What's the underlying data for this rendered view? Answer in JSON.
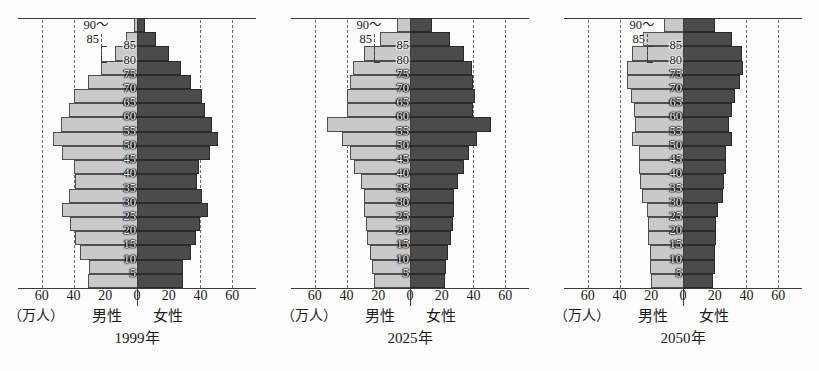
{
  "figure": {
    "unit_label": "（万人）",
    "male_label": "男性",
    "female_label": "女性",
    "age_top_label": "90～",
    "age_second_label": "85",
    "colors": {
      "male_bar": "#c9c9c9",
      "female_bar": "#4b4b4b",
      "gridline": "#6b6b90",
      "axis": "#3a3a3a",
      "background": "#fdfdfd"
    }
  },
  "chart_data": [
    {
      "type": "bar",
      "title": "1999年",
      "subtype": "population-pyramid",
      "xlabel": "（万人）",
      "ylabel": "",
      "xlim": [
        -75,
        75
      ],
      "xticks": [
        -60,
        -40,
        -20,
        0,
        20,
        40,
        60
      ],
      "xticklabels": [
        "60",
        "40",
        "20",
        "0",
        "20",
        "40",
        "60"
      ],
      "grid": true,
      "gridline_values": [
        -60,
        -40,
        40,
        60
      ],
      "legend": [
        "男性",
        "女性"
      ],
      "categories": [
        "0～4",
        "5～9",
        "10～14",
        "15～19",
        "20～24",
        "25～29",
        "30～34",
        "35～39",
        "40～44",
        "45～49",
        "50～54",
        "55～59",
        "60～64",
        "65～69",
        "70～74",
        "75～79",
        "80～84",
        "85～89",
        "90～"
      ],
      "ytick_labels": [
        "5",
        "10",
        "15",
        "20",
        "25",
        "30",
        "35",
        "40",
        "45",
        "50",
        "55",
        "60",
        "65",
        "70",
        "75",
        "80",
        "85",
        "90～"
      ],
      "series": [
        {
          "name": "男性",
          "values": [
            31,
            30,
            36,
            39,
            42,
            47,
            43,
            39,
            40,
            47,
            53,
            48,
            43,
            40,
            31,
            23,
            14,
            7,
            2
          ]
        },
        {
          "name": "女性",
          "values": [
            29,
            29,
            34,
            37,
            40,
            45,
            41,
            38,
            39,
            46,
            51,
            47,
            43,
            41,
            34,
            28,
            20,
            12,
            5
          ]
        }
      ]
    },
    {
      "type": "bar",
      "title": "2025年",
      "subtype": "population-pyramid",
      "xlabel": "（万人）",
      "ylabel": "",
      "xlim": [
        -75,
        75
      ],
      "xticks": [
        -60,
        -40,
        -20,
        0,
        20,
        40,
        60
      ],
      "xticklabels": [
        "60",
        "40",
        "20",
        "0",
        "20",
        "40",
        "60"
      ],
      "grid": true,
      "gridline_values": [
        -60,
        -40,
        40,
        60
      ],
      "legend": [
        "男性",
        "女性"
      ],
      "categories": [
        "0～4",
        "5～9",
        "10～14",
        "15～19",
        "20～24",
        "25～29",
        "30～34",
        "35～39",
        "40～44",
        "45～49",
        "50～54",
        "55～59",
        "60～64",
        "65～69",
        "70～74",
        "75～79",
        "80～84",
        "85～89",
        "90～"
      ],
      "ytick_labels": [
        "5",
        "10",
        "15",
        "20",
        "25",
        "30",
        "35",
        "40",
        "45",
        "50",
        "55",
        "60",
        "65",
        "70",
        "75",
        "80",
        "85",
        "90～"
      ],
      "series": [
        {
          "name": "男性",
          "values": [
            23,
            24,
            25,
            27,
            28,
            29,
            29,
            31,
            35,
            38,
            43,
            52,
            40,
            40,
            38,
            36,
            29,
            19,
            8
          ]
        },
        {
          "name": "女性",
          "values": [
            22,
            23,
            24,
            26,
            27,
            28,
            28,
            30,
            34,
            37,
            42,
            51,
            40,
            41,
            40,
            39,
            34,
            25,
            14
          ]
        }
      ]
    },
    {
      "type": "bar",
      "title": "2050年",
      "subtype": "population-pyramid",
      "xlabel": "（万人）",
      "ylabel": "",
      "xlim": [
        -75,
        75
      ],
      "xticks": [
        -60,
        -40,
        -20,
        0,
        20,
        40,
        60
      ],
      "xticklabels": [
        "60",
        "40",
        "20",
        "0",
        "20",
        "40",
        "60"
      ],
      "grid": true,
      "gridline_values": [
        -60,
        -40,
        40,
        60
      ],
      "legend": [
        "男性",
        "女性"
      ],
      "categories": [
        "0～4",
        "5～9",
        "10～14",
        "15～19",
        "20～24",
        "25～29",
        "30～34",
        "35～39",
        "40～44",
        "45～49",
        "50～54",
        "55～59",
        "60～64",
        "65～69",
        "70～74",
        "75～79",
        "80～84",
        "85～89",
        "90～"
      ],
      "ytick_labels": [
        "5",
        "10",
        "15",
        "20",
        "25",
        "30",
        "35",
        "40",
        "45",
        "50",
        "55",
        "60",
        "65",
        "70",
        "75",
        "80",
        "85",
        "90～"
      ],
      "series": [
        {
          "name": "男性",
          "values": [
            20,
            21,
            21,
            22,
            22,
            23,
            26,
            27,
            28,
            28,
            32,
            30,
            31,
            33,
            35,
            35,
            32,
            25,
            12
          ]
        },
        {
          "name": "女性",
          "values": [
            19,
            20,
            20,
            21,
            21,
            22,
            25,
            26,
            27,
            27,
            31,
            29,
            31,
            33,
            36,
            38,
            37,
            31,
            20
          ]
        }
      ]
    }
  ]
}
